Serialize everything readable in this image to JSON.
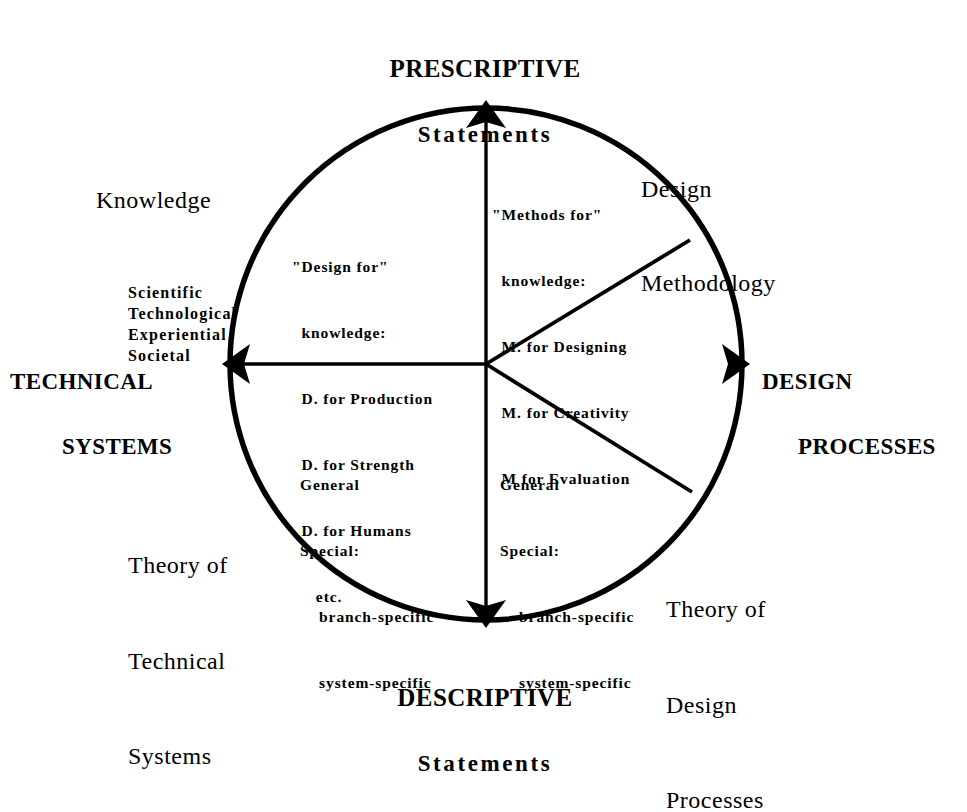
{
  "diagram": {
    "title_poles": {
      "top": {
        "line1": "PRESCRIPTIVE",
        "line2": "Statements"
      },
      "bottom": {
        "line1": "DESCRIPTIVE",
        "line2": "Statements"
      },
      "left": {
        "line1": "TECHNICAL",
        "line2": "SYSTEMS"
      },
      "right": {
        "line1": "DESIGN",
        "line2": "PROCESSES"
      }
    },
    "corners": {
      "knowledge": {
        "heading": "Knowledge",
        "items": "Scientific\nTechnological\nExperiential\nSocietal"
      },
      "design_methodology": {
        "line1": "Design",
        "line2": "Methodology"
      },
      "theory_of_technical_systems": {
        "line1": "Theory of",
        "line2": "Technical",
        "line3": "Systems"
      },
      "theory_of_design_processes": {
        "line1": "Theory of",
        "line2": "Design",
        "line3": "Processes"
      }
    },
    "sectors": {
      "design_for": {
        "line1": "\"Design for\"",
        "line2": "  knowledge:",
        "line3": "  D. for Production",
        "line4": "  D. for Strength",
        "line5": "  D. for Humans",
        "line6": "     etc."
      },
      "methods_for": {
        "line1": "\"Methods for\"",
        "line2": "  knowledge:",
        "line3": "  M. for Designing",
        "line4": "  M. for Creativity",
        "line5": "  M for Evaluation"
      },
      "general_special_left": {
        "line1": "General",
        "line2": "Special:",
        "line3": "    branch-specific",
        "line4": "    system-specific"
      },
      "general_special_right": {
        "line1": "General",
        "line2": "Special:",
        "line3": "    branch-specific",
        "line4": "    system-specific"
      }
    },
    "geometry": {
      "center_x": 486,
      "center_y": 364,
      "radius": 256,
      "stroke_color": "#000000",
      "background_color": "#ffffff",
      "arrow_directions": "up, down, left, right",
      "spoke_count": 5
    }
  }
}
